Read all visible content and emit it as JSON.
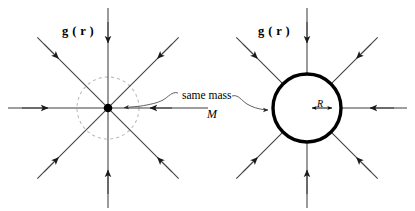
{
  "figure": {
    "background_color": "#ffffff",
    "line_color": "#3a3a3a",
    "solid_color": "#000000",
    "dashed_color": "#b8b8b8",
    "panels": [
      {
        "id": "left-panel",
        "name": "point-mass-panel",
        "center_x": 108,
        "center_y": 108,
        "body_type": "point-mass",
        "dot_radius": 4,
        "gaussian_surface_radius": 31,
        "gaussian_surface_style": "dashed",
        "field_label": {
          "text_prefix": "g",
          "text_open": "(",
          "text_var": "r",
          "text_close": ")",
          "full": "g ( r )",
          "x": 62,
          "y": 32
        }
      },
      {
        "id": "right-panel",
        "name": "uniform-sphere-panel",
        "center_x": 307,
        "center_y": 108,
        "body_type": "solid-sphere",
        "sphere_radius": 34,
        "sphere_stroke_width": 3.4,
        "radius_label": {
          "text": "R",
          "x": 318,
          "y": 104
        },
        "field_label": {
          "text_prefix": "g",
          "text_open": "(",
          "text_var": "r",
          "text_close": ")",
          "full": "g ( r )",
          "x": 258,
          "y": 32
        }
      }
    ],
    "field_lines": {
      "count_per_panel": 8,
      "angles_deg": [
        0,
        45,
        90,
        135,
        180,
        225,
        270,
        315
      ],
      "direction": "inward",
      "length": 100,
      "arrow_position_fraction": 0.5
    },
    "annotation": {
      "name": "same-mass-callout",
      "line1": "same mass",
      "line2": "M",
      "line1_x": 182,
      "line1_y": 95,
      "line2_x": 208,
      "line2_y": 111,
      "leader_left_target": "point-mass-dot",
      "leader_right_target": "sphere-surface"
    }
  }
}
